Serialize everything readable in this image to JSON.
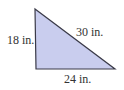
{
  "figure": {
    "type": "right-triangle",
    "vertices": {
      "top": [
        35,
        9
      ],
      "bottom_left": [
        36,
        69
      ],
      "bottom_right": [
        115,
        69
      ]
    },
    "colors": {
      "fill": "#c9cdee",
      "stroke": "#3a3a48",
      "text": "#333333",
      "background": "#ffffff"
    },
    "labels": {
      "vertical_leg": "18 in.",
      "hypotenuse": "30 in.",
      "horizontal_leg": "24 in."
    }
  }
}
